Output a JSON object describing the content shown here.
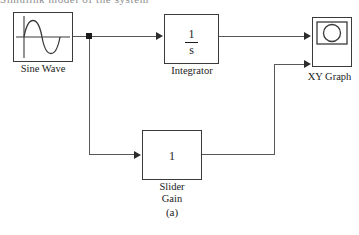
{
  "figure": {
    "caption": "(a)",
    "clipped_header_text": "Simulink model of the system"
  },
  "colors": {
    "block_border": "#3a3a3a",
    "wire": "#55595c",
    "arrow": "#2c2c2c",
    "junction": "#1a1a1a",
    "background": "#ffffff",
    "text": "#1c1c1c"
  },
  "blocks": {
    "sine_wave": {
      "label": "Sine Wave",
      "icon": "sine-wave-icon",
      "x": 13,
      "y": 12,
      "w": 60,
      "h": 50
    },
    "integrator": {
      "label": "Integrator",
      "numerator": "1",
      "denominator": "s",
      "x": 164,
      "y": 14,
      "w": 55,
      "h": 50
    },
    "xy_graph": {
      "label": "XY Graph",
      "icon": "xy-graph-icon",
      "x": 312,
      "y": 17,
      "w": 40,
      "h": 50
    },
    "slider_gain": {
      "label": "Slider\nGain",
      "value": "1",
      "x": 142,
      "y": 130,
      "w": 60,
      "h": 50
    }
  },
  "connections": [
    {
      "name": "sine-to-junction"
    },
    {
      "name": "junction-to-integrator"
    },
    {
      "name": "junction-down-to-slider-gain"
    },
    {
      "name": "integrator-to-xy-graph-input1"
    },
    {
      "name": "slider-gain-to-xy-graph-input2"
    }
  ]
}
